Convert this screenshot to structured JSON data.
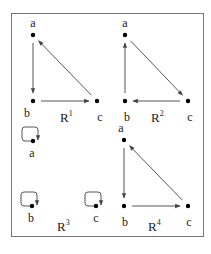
{
  "figure": {
    "border_color": "#777777",
    "edge_color": "#444444",
    "node_color": "#000000"
  },
  "relations": [
    {
      "name": "R1",
      "label_base": "R",
      "label_sup": "1",
      "label_pos": [
        60,
        122
      ],
      "nodes": [
        {
          "id": "a",
          "label": "a",
          "x": 33,
          "y": 35,
          "lx": 33,
          "ly": 27
        },
        {
          "id": "b",
          "label": "b",
          "x": 33,
          "y": 101,
          "lx": 27,
          "ly": 117
        },
        {
          "id": "c",
          "label": "c",
          "x": 97,
          "y": 101,
          "lx": 100,
          "ly": 121
        }
      ],
      "edges": [
        {
          "from": "a",
          "to": "b"
        },
        {
          "from": "b",
          "to": "c"
        },
        {
          "from": "c",
          "to": "a"
        }
      ]
    },
    {
      "name": "R2",
      "label_base": "R",
      "label_sup": "2",
      "label_pos": [
        151,
        122
      ],
      "nodes": [
        {
          "id": "a",
          "label": "a",
          "x": 125,
          "y": 35,
          "lx": 125,
          "ly": 27
        },
        {
          "id": "b",
          "label": "b",
          "x": 125,
          "y": 101,
          "lx": 127,
          "ly": 121
        },
        {
          "id": "c",
          "label": "c",
          "x": 188,
          "y": 101,
          "lx": 190,
          "ly": 121
        }
      ],
      "edges": [
        {
          "from": "b",
          "to": "a"
        },
        {
          "from": "a",
          "to": "c"
        },
        {
          "from": "c",
          "to": "b"
        }
      ]
    },
    {
      "name": "R3",
      "label_base": "R",
      "label_sup": "3",
      "label_pos": [
        57,
        231
      ],
      "nodes": [
        {
          "id": "a",
          "label": "a",
          "x": 33,
          "y": 141,
          "lx": 32,
          "ly": 157
        },
        {
          "id": "b",
          "label": "b",
          "x": 32,
          "y": 206,
          "lx": 31,
          "ly": 222
        },
        {
          "id": "c",
          "label": "c",
          "x": 96,
          "y": 206,
          "lx": 96,
          "ly": 222
        }
      ],
      "loops": [
        "a",
        "b",
        "c"
      ]
    },
    {
      "name": "R4",
      "label_base": "R",
      "label_sup": "4",
      "label_pos": [
        148,
        231
      ],
      "nodes": [
        {
          "id": "a",
          "label": "a",
          "x": 124,
          "y": 140,
          "lx": 121,
          "ly": 132
        },
        {
          "id": "b",
          "label": "b",
          "x": 124,
          "y": 206,
          "lx": 125,
          "ly": 226
        },
        {
          "id": "c",
          "label": "c",
          "x": 188,
          "y": 206,
          "lx": 189,
          "ly": 226
        }
      ],
      "edges": [
        {
          "from": "a",
          "to": "b"
        },
        {
          "from": "b",
          "to": "c"
        },
        {
          "from": "c",
          "to": "a"
        }
      ]
    }
  ]
}
